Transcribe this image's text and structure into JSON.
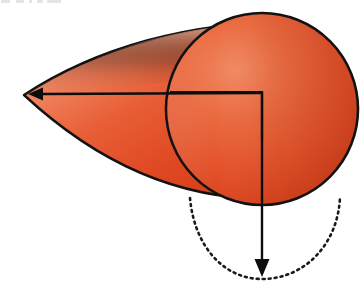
{
  "figure": {
    "domain_label": "geometry-diagram",
    "background_color": "#ffffff",
    "width": 361,
    "height": 290
  },
  "colors": {
    "cone_fill_light": "#f08a6a",
    "cone_fill_mid": "#e85a33",
    "cone_fill_dark": "#d83c18",
    "circle_fill_light": "#ef7d55",
    "circle_fill_mid": "#e4512a",
    "circle_fill_dark": "#cf3a16",
    "outline": "#121212",
    "dotted_curve": "#1a1a1a",
    "arrow": "#0d0d0d"
  },
  "shapes": {
    "cone_body": {
      "name": "cone-lateral-surface",
      "apex": {
        "x": 24,
        "y": 95
      },
      "upper_edge_end": {
        "x": 300,
        "y": 22
      },
      "lower_edge_end": {
        "x": 288,
        "y": 198
      },
      "stroke_width": 2.4
    },
    "base_circle": {
      "name": "cone-base-circle",
      "center": {
        "x": 262,
        "y": 109
      },
      "radius": 96,
      "stroke_width": 2.6
    },
    "dotted_arc": {
      "name": "projected-base-ellipse-arc",
      "start": {
        "x": 190,
        "y": 198
      },
      "vertex": {
        "x": 262,
        "y": 279
      },
      "end": {
        "x": 340,
        "y": 197
      },
      "dash_pattern": "2 4",
      "stroke_width": 2.6
    }
  },
  "annotations": {
    "axis_arrow_horizontal": {
      "name": "cone-axis-arrow",
      "from": {
        "x": 262,
        "y": 93
      },
      "to": {
        "x": 28,
        "y": 94
      },
      "direction": "left",
      "stroke_width": 2.4,
      "head_length": 15,
      "head_width": 13
    },
    "axis_arrow_vertical": {
      "name": "base-radius-arrow",
      "from": {
        "x": 262,
        "y": 92
      },
      "to": {
        "x": 262,
        "y": 277
      },
      "direction": "down",
      "stroke_width": 2.4,
      "head_length": 18,
      "head_width": 15
    },
    "right_angle_mark": {
      "name": "right-angle-corner",
      "corner": {
        "x": 262,
        "y": 92
      },
      "horizontal_extent": 92,
      "vertical_extent": 48,
      "stroke_width": 2.2
    }
  },
  "scan_artifacts": [
    {
      "left": 1,
      "width": 9
    },
    {
      "left": 16,
      "width": 8
    },
    {
      "left": 29,
      "width": 3
    },
    {
      "left": 37,
      "width": 6
    },
    {
      "left": 47,
      "width": 14
    }
  ]
}
